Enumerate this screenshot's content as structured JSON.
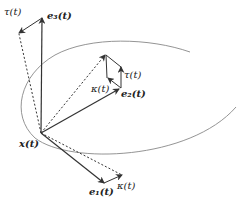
{
  "diagram": {
    "labels": {
      "position": "x(t)",
      "e1": "e₁(t)",
      "e2": "e₂(t)",
      "e3": "e₃(t)",
      "tau_top": "τ(t)",
      "tau_mid": "τ(t)",
      "kappa_mid": "κ(t)",
      "kappa_bottom": "κ(t)"
    },
    "colors": {
      "curve": "#888888",
      "vectors": "#333333"
    }
  }
}
